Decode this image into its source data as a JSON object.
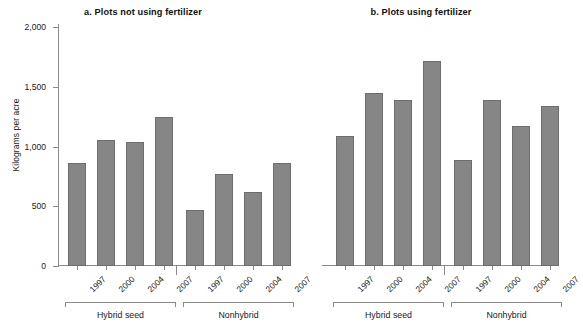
{
  "figure": {
    "ylabel": "Kilograms per acre",
    "bar_color": "#868686",
    "bar_edge_color": "#6d6d6d",
    "axis_color": "#8a8a8a"
  },
  "chart_data": [
    {
      "type": "bar",
      "title": "a. Plots not using fertilizer",
      "xlabel": "",
      "ylabel": "Kilograms per acre",
      "ylim": [
        0,
        2000
      ],
      "yticks": [
        0,
        500,
        1000,
        1500,
        2000
      ],
      "ytick_labels": [
        "0",
        "500",
        "1,000",
        "1,500",
        "2,000"
      ],
      "grid": false,
      "legend": "none",
      "groups": [
        {
          "label": "Hybrid seed",
          "categories": [
            "1997",
            "2000",
            "2004",
            "2007"
          ],
          "values": [
            860,
            1055,
            1035,
            1245
          ]
        },
        {
          "label": "Nonhybrid",
          "categories": [
            "1997",
            "2000",
            "2004",
            "2007"
          ],
          "values": [
            470,
            770,
            620,
            860
          ]
        }
      ]
    },
    {
      "type": "bar",
      "title": "b. Plots using fertilizer",
      "xlabel": "",
      "ylabel": "",
      "ylim": [
        0,
        2000
      ],
      "yticks": [
        0,
        500,
        1000,
        1500,
        2000
      ],
      "ytick_labels": [
        "0",
        "500",
        "1,000",
        "1,500",
        "2,000"
      ],
      "grid": false,
      "legend": "none",
      "groups": [
        {
          "label": "Hybrid seed",
          "categories": [
            "1997",
            "2000",
            "2004",
            "2007"
          ],
          "values": [
            1090,
            1450,
            1390,
            1715
          ]
        },
        {
          "label": "Nonhybrid",
          "categories": [
            "1997",
            "2000",
            "2004",
            "2007"
          ],
          "values": [
            890,
            1390,
            1170,
            1335
          ]
        }
      ]
    }
  ]
}
